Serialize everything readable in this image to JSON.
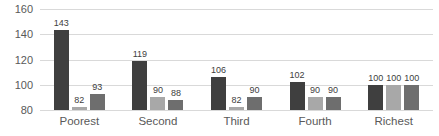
{
  "chart_data": {
    "type": "bar",
    "title": "",
    "categories": [
      "Poorest",
      "Second",
      "Third",
      "Fourth",
      "Richest"
    ],
    "series": [
      {
        "name": "",
        "color": "#3f3f3f",
        "values": [
          143,
          119,
          106,
          102,
          100
        ]
      },
      {
        "name": "",
        "color": "#a8a8a8",
        "values": [
          82,
          90,
          82,
          90,
          100
        ]
      },
      {
        "name": "",
        "color": "#6e6e6e",
        "values": [
          93,
          88,
          90,
          90,
          100
        ]
      }
    ],
    "data_labels": true,
    "xlabel": "",
    "ylabel": "",
    "ylim": [
      80,
      160
    ],
    "yticks": [
      80,
      100,
      120,
      140,
      160
    ],
    "grid": "horizontal",
    "legend": "none",
    "colors": {
      "gridline": "#d9d9d9",
      "axis_label": "#595959",
      "data_label": "#404040",
      "background": "#ffffff"
    }
  }
}
